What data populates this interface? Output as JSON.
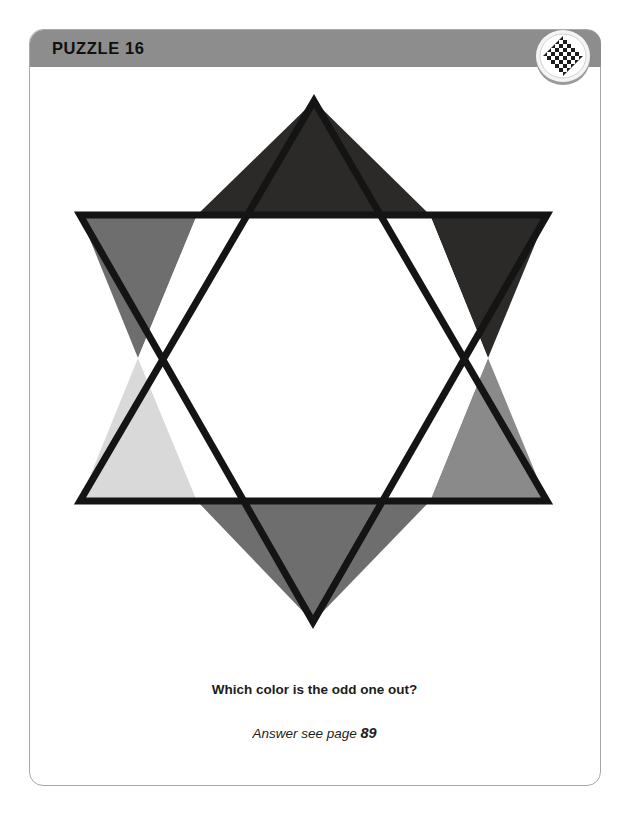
{
  "page": {
    "frame_border_color": "#a8a8a8",
    "background_color": "#ffffff"
  },
  "header": {
    "title": "PUZZLE 16",
    "bar_color": "#8d8d8d",
    "title_color": "#101010",
    "badge": {
      "icon_name": "checkerboard-diamond-badge",
      "ring_color": "#f2f2f2",
      "shadow_color": "#9a9a9a",
      "pattern_color": "#1c1c1c"
    }
  },
  "figure": {
    "name": "six-pointed-star",
    "outline_color": "#141414",
    "outline_width": 7,
    "triangles": [
      {
        "position": "top",
        "color": "#2b2a28",
        "label": "near-black"
      },
      {
        "position": "upper-right",
        "color": "#2b2a28",
        "label": "near-black"
      },
      {
        "position": "lower-right",
        "color": "#8a8a8a",
        "label": "medium-gray"
      },
      {
        "position": "bottom",
        "color": "#6e6e6e",
        "label": "medium-dark-gray"
      },
      {
        "position": "lower-left",
        "color": "#d9d9d9",
        "label": "light-gray"
      },
      {
        "position": "upper-left",
        "color": "#6e6e6e",
        "label": "medium-dark-gray"
      }
    ],
    "center_color": "#ffffff"
  },
  "question": {
    "prompt": "Which color is the odd one out?",
    "answer_prefix": "Answer see page",
    "answer_page": "89"
  }
}
